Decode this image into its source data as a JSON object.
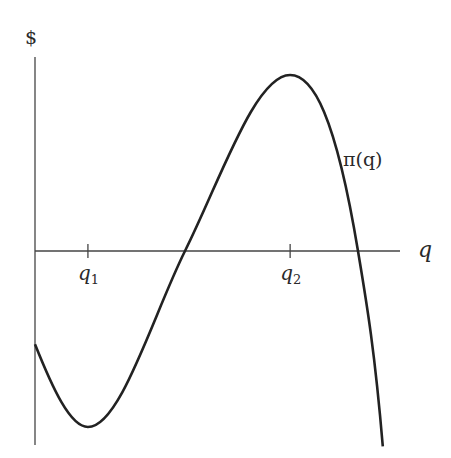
{
  "chart_data": {
    "type": "line",
    "title": "",
    "ylabel": "$",
    "xlabel": "q",
    "curve_label": "π(q)",
    "ticks": [
      {
        "name": "q1",
        "label": "q",
        "sub": "1",
        "x": 0.145
      },
      {
        "name": "q2",
        "label": "q",
        "sub": "2",
        "x": 0.699
      }
    ],
    "xlim": [
      0,
      1
    ],
    "ylim": [
      -1.11,
      1.1
    ],
    "series": [
      {
        "name": "π(q)",
        "points": [
          [
            0.0,
            -0.53
          ],
          [
            0.145,
            -1.0
          ],
          [
            0.411,
            0.0
          ],
          [
            0.699,
            1.0
          ],
          [
            0.885,
            0.0
          ],
          [
            0.953,
            -1.11
          ]
        ]
      }
    ],
    "grid": false,
    "line_color": "#222222",
    "axis_color": "#444444"
  }
}
